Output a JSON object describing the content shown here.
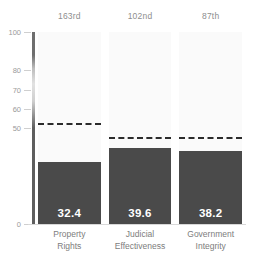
{
  "chart_data": {
    "type": "bar",
    "title": "",
    "xlabel": "",
    "ylabel": "",
    "ylim": [
      0,
      100
    ],
    "grid": false,
    "legend": "none",
    "categories": [
      "Property Rights",
      "Judicial Effectiveness",
      "Government Integrity"
    ],
    "category_lines": [
      [
        "Property",
        "Rights"
      ],
      [
        "Judicial",
        "Effectiveness"
      ],
      [
        "Government",
        "Integrity"
      ]
    ],
    "values": [
      32.4,
      39.6,
      38.2
    ],
    "value_labels": [
      "32.4",
      "39.6",
      "38.2"
    ],
    "rank_labels": [
      "163rd",
      "102nd",
      "87th"
    ],
    "reference_lines": [
      51.5,
      44.3,
      44.3
    ],
    "ytick_values": [
      100,
      80,
      70,
      60,
      50,
      0
    ],
    "ytick_labels": [
      "100",
      "80",
      "70",
      "60",
      "50",
      "0"
    ],
    "colors": {
      "bar": "#4a4a4a",
      "column_background": "#fafafa",
      "reference_line": "#2b2b2b",
      "value_label": "#ffffff",
      "tick_label": "#9a9a9a",
      "category_label": "#7d7d7d",
      "rank_label": "#8e8e8e",
      "page_background": "#ffffff"
    }
  }
}
